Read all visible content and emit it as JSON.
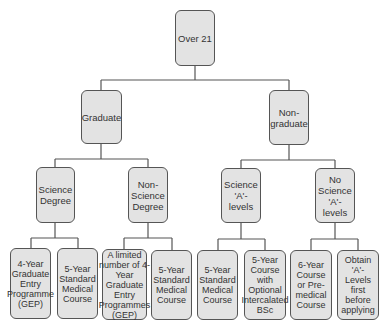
{
  "diagram": {
    "root": {
      "label": "Over 21"
    },
    "level1": [
      {
        "label": "Graduate"
      },
      {
        "label": "Non-graduate"
      }
    ],
    "level2": [
      {
        "label": "Science Degree",
        "parent": "Graduate"
      },
      {
        "label": "Non-Science Degree",
        "parent": "Graduate"
      },
      {
        "label": "Science 'A'-levels",
        "parent": "Non-graduate"
      },
      {
        "label": "No Science 'A'-levels",
        "parent": "Non-graduate"
      }
    ],
    "leaves": [
      {
        "label": "4-Year Graduate Entry Programme (GEP)",
        "parent": "Science Degree"
      },
      {
        "label": "5-Year Standard Medical Course",
        "parent": "Science Degree"
      },
      {
        "label": "A limited number of 4-Year Graduate Entry Programmes (GEP)",
        "parent": "Non-Science Degree"
      },
      {
        "label": "5-Year Standard Medical Course",
        "parent": "Non-Science Degree"
      },
      {
        "label": "5-Year Standard Medical Course",
        "parent": "Science 'A'-levels"
      },
      {
        "label": "5-Year Course with Optional Intercalated BSc",
        "parent": "Science 'A'-levels"
      },
      {
        "label": "6-Year Course or Pre-medical Course",
        "parent": "No Science 'A'-levels"
      },
      {
        "label": "Obtain 'A'-Levels first before applying",
        "parent": "No Science 'A'-levels"
      }
    ]
  }
}
